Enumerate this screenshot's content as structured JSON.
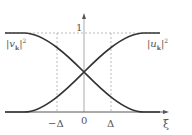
{
  "diagram": {
    "y_tick_label": "1",
    "x_axis_label": "ξ",
    "x_ticks": [
      "−Δ",
      "0",
      "Δ"
    ],
    "curve_labels": {
      "v": "|v",
      "v_sub": "k",
      "v_sup": "2",
      "u": "|u",
      "u_sub": "k",
      "u_sup": "2"
    },
    "colors": {
      "curve": "#333333",
      "axis": "#aaaaaa",
      "dash": "#aaaaaa",
      "text": "#555555"
    }
  }
}
